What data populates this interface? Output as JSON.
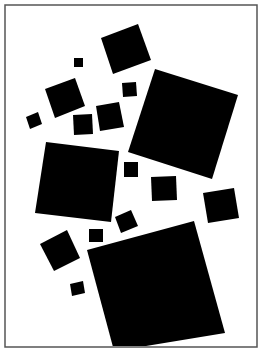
{
  "artwork": {
    "background": "#ffffff",
    "frame": {
      "x": 5,
      "y": 5,
      "width": 252,
      "height": 342,
      "stroke": "#555555"
    },
    "fill_color": "#000000",
    "squares": [
      {
        "name": "top-square",
        "points": "101,38 138,24 151,60 113,74"
      },
      {
        "name": "tiny-square-top",
        "points": "74,58 83,58 83,67 74,67"
      },
      {
        "name": "upper-left-square",
        "points": "45,89 75,78 85,106 55,118"
      },
      {
        "name": "small-square-upper",
        "points": "122,83 136,82 137,96 123,97"
      },
      {
        "name": "tiny-square-left",
        "points": "26,117 38,112 42,124 30,129"
      },
      {
        "name": "small-square-mid-left",
        "points": "73,115 92,114 93,134 74,135"
      },
      {
        "name": "mid-square",
        "points": "96,106 119,102 124,127 100,131"
      },
      {
        "name": "large-right-square",
        "points": "155,69 238,95 212,179 128,152"
      },
      {
        "name": "large-left-square",
        "points": "46,142 119,151 111,222 35,213"
      },
      {
        "name": "small-square-center",
        "points": "124,162 138,162 138,177 124,177"
      },
      {
        "name": "small-square-right-center",
        "points": "151,177 176,176 177,200 152,201"
      },
      {
        "name": "right-square",
        "points": "203,193 234,188 239,218 208,223"
      },
      {
        "name": "small-square-tilted",
        "points": "115,217 131,210 138,226 121,233"
      },
      {
        "name": "tiny-square-bottom-center",
        "points": "89,229 103,229 103,242 89,242"
      },
      {
        "name": "lower-left-square",
        "points": "40,244 67,230 80,258 54,271"
      },
      {
        "name": "tiny-square-bottom-left",
        "points": "70,284 83,281 85,293 72,296"
      },
      {
        "name": "large-bottom-square",
        "points": "87,250 194,221 225,333 140,347 113,347"
      }
    ]
  }
}
